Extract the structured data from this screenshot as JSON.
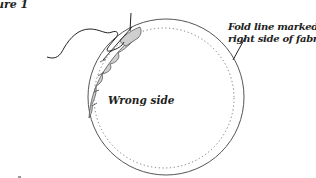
{
  "figure": {
    "visible_title": "ure 1"
  },
  "labels": {
    "fold_line_line1": "Fold line marked on",
    "fold_line_line2": "right side of fabric",
    "wrong_side": "Wrong side"
  },
  "colors": {
    "outline": "#555555",
    "dotted": "#777777",
    "shading": "#cfcfcf",
    "thread": "#222222",
    "text": "#222222"
  }
}
